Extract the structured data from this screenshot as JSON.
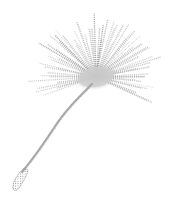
{
  "image": {
    "subject": "dandelion seed",
    "style": "halftone illustration",
    "alt": "Halftone illustration of a single dandelion seed with a radiating pappus and a thin curved stalk",
    "colors": {
      "background": "#ffffff",
      "ink": "#8a8a8a",
      "ink_light": "#c4c4c4"
    }
  }
}
